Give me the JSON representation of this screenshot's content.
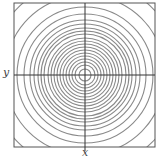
{
  "figure": {
    "type": "contour-plot",
    "x_label": "x",
    "y_label": "y",
    "center": [
      85,
      75
    ],
    "box": {
      "x0": 14,
      "y0": 3,
      "x1": 155,
      "y1": 147
    },
    "ring_radii": [
      6,
      10,
      13,
      16,
      19,
      22,
      25,
      28,
      31,
      34,
      37,
      41,
      44,
      47,
      51,
      55,
      61,
      68,
      80,
      95
    ],
    "colors": {
      "rings": "#8a8a8a",
      "axes": "#333333",
      "box": "#555555"
    }
  }
}
